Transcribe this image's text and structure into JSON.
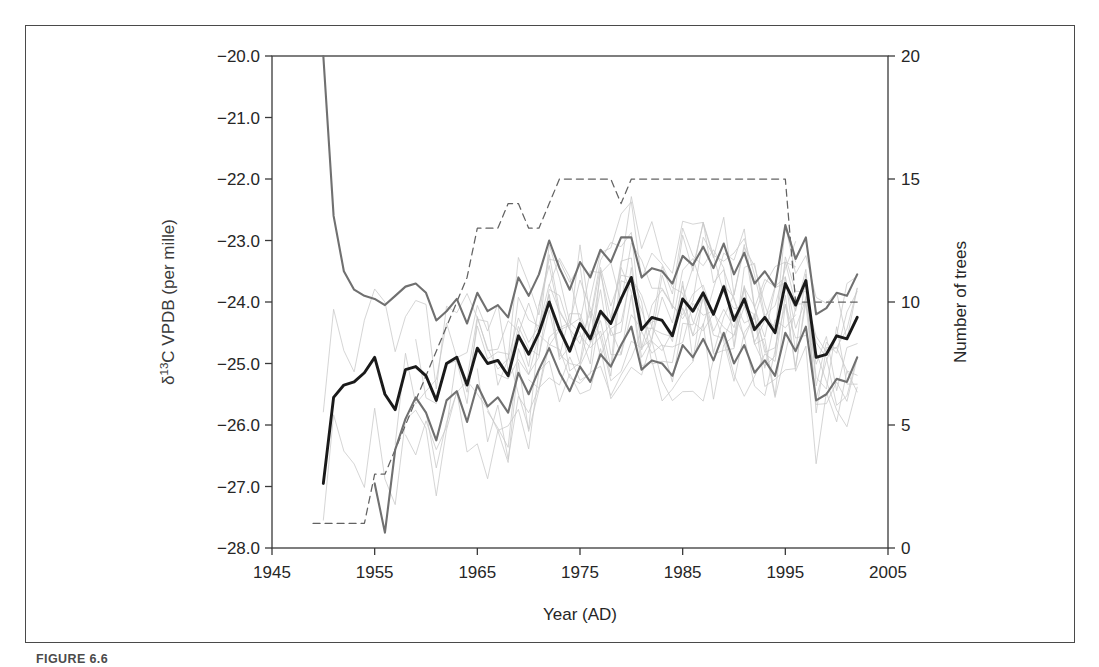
{
  "figure": {
    "caption_label": "FIGURE 6.6",
    "caption_rest": ""
  },
  "chart_data": {
    "type": "line",
    "title": "",
    "xlabel": "Year (AD)",
    "ylabel": "δ¹³C VPDB (per mille)",
    "ylabel_parts": {
      "delta": "δ",
      "sup": "13",
      "rest": "C VPDB (per mille)"
    },
    "y2label": "Number of trees",
    "xlim": [
      1945,
      2005
    ],
    "ylim": [
      -28.0,
      -20.0
    ],
    "y2lim": [
      0,
      20
    ],
    "grid": false,
    "legend": "none",
    "xticks": [
      1945,
      1955,
      1965,
      1975,
      1985,
      1995,
      2005
    ],
    "xticklabels": [
      "1945",
      "1955",
      "1965",
      "1975",
      "1985",
      "1995",
      "2005"
    ],
    "yticks": [
      -28.0,
      -27.0,
      -26.0,
      -25.0,
      -24.0,
      -23.0,
      -22.0,
      -21.0,
      -20.0
    ],
    "yticklabels": [
      "-28.0",
      "-27.0",
      "-26.0",
      "-25.0",
      "-24.0",
      "-23.0",
      "-22.0",
      "-21.0",
      "-20.0"
    ],
    "y2ticks": [
      0,
      5,
      10,
      15,
      20
    ],
    "y2ticklabels": [
      "0",
      "5",
      "10",
      "15",
      "20"
    ],
    "colors": {
      "mean": "#1a1a1a",
      "envelope": "#707070",
      "individual": "#c8c8c8",
      "treecount": "#5a5a5a",
      "axis": "#3a3a3a",
      "frame": "#4a4a4a"
    },
    "series": [
      {
        "name": "Mean δ13C",
        "role": "mean",
        "axis": "left",
        "style": "solid-thick",
        "x": [
          1950,
          1951,
          1952,
          1953,
          1954,
          1955,
          1956,
          1957,
          1958,
          1959,
          1960,
          1961,
          1962,
          1963,
          1964,
          1965,
          1966,
          1967,
          1968,
          1969,
          1970,
          1971,
          1972,
          1973,
          1974,
          1975,
          1976,
          1977,
          1978,
          1979,
          1980,
          1981,
          1982,
          1983,
          1984,
          1985,
          1986,
          1987,
          1988,
          1989,
          1990,
          1991,
          1992,
          1993,
          1994,
          1995,
          1996,
          1997,
          1998,
          1999,
          2000,
          2001,
          2002
        ],
        "values": [
          -26.95,
          -25.55,
          -25.35,
          -25.3,
          -25.15,
          -24.9,
          -25.5,
          -25.75,
          -25.1,
          -25.05,
          -25.2,
          -25.6,
          -25.0,
          -24.9,
          -25.35,
          -24.75,
          -25.0,
          -24.95,
          -25.2,
          -24.55,
          -24.85,
          -24.5,
          -24.0,
          -24.45,
          -24.8,
          -24.35,
          -24.6,
          -24.15,
          -24.35,
          -23.95,
          -23.6,
          -24.45,
          -24.25,
          -24.3,
          -24.55,
          -23.95,
          -24.15,
          -23.85,
          -24.2,
          -23.75,
          -24.3,
          -23.95,
          -24.45,
          -24.25,
          -24.5,
          -23.7,
          -24.05,
          -23.65,
          -24.9,
          -24.85,
          -24.55,
          -24.6,
          -24.25
        ]
      },
      {
        "name": "Upper envelope",
        "role": "upper",
        "axis": "left",
        "style": "solid-medium",
        "x": [
          1950,
          1951,
          1952,
          1953,
          1954,
          1955,
          1956,
          1957,
          1958,
          1959,
          1960,
          1961,
          1962,
          1963,
          1964,
          1965,
          1966,
          1967,
          1968,
          1969,
          1970,
          1971,
          1972,
          1973,
          1974,
          1975,
          1976,
          1977,
          1978,
          1979,
          1980,
          1981,
          1982,
          1983,
          1984,
          1985,
          1986,
          1987,
          1988,
          1989,
          1990,
          1991,
          1992,
          1993,
          1994,
          1995,
          1996,
          1997,
          1998,
          1999,
          2000,
          2001,
          2002
        ],
        "values": [
          -20.0,
          -22.6,
          -23.5,
          -23.8,
          -23.9,
          -23.95,
          -24.05,
          -23.9,
          -23.75,
          -23.7,
          -23.85,
          -24.3,
          -24.15,
          -23.95,
          -24.35,
          -23.85,
          -24.15,
          -24.05,
          -24.25,
          -23.6,
          -23.9,
          -23.55,
          -23.0,
          -23.45,
          -23.8,
          -23.35,
          -23.6,
          -23.15,
          -23.35,
          -22.95,
          -22.95,
          -23.6,
          -23.45,
          -23.5,
          -23.7,
          -23.25,
          -23.4,
          -23.1,
          -23.45,
          -23.05,
          -23.55,
          -23.2,
          -23.7,
          -23.5,
          -23.75,
          -22.75,
          -23.3,
          -22.95,
          -24.2,
          -24.1,
          -23.85,
          -23.9,
          -23.55
        ]
      },
      {
        "name": "Lower envelope",
        "role": "lower",
        "axis": "left",
        "style": "solid-medium",
        "x": [
          1955,
          1956,
          1957,
          1958,
          1959,
          1960,
          1961,
          1962,
          1963,
          1964,
          1965,
          1966,
          1967,
          1968,
          1969,
          1970,
          1971,
          1972,
          1973,
          1974,
          1975,
          1976,
          1977,
          1978,
          1979,
          1980,
          1981,
          1982,
          1983,
          1984,
          1985,
          1986,
          1987,
          1988,
          1989,
          1990,
          1991,
          1992,
          1993,
          1994,
          1995,
          1996,
          1997,
          1998,
          1999,
          2000,
          2001,
          2002
        ],
        "values": [
          -26.95,
          -27.75,
          -26.4,
          -25.9,
          -25.55,
          -25.8,
          -26.25,
          -25.6,
          -25.45,
          -25.95,
          -25.35,
          -25.7,
          -25.55,
          -25.8,
          -25.15,
          -25.5,
          -25.1,
          -24.75,
          -25.15,
          -25.45,
          -25.05,
          -25.3,
          -24.85,
          -25.05,
          -24.7,
          -24.4,
          -25.1,
          -24.95,
          -25.0,
          -25.2,
          -24.7,
          -24.9,
          -24.6,
          -24.95,
          -24.5,
          -25.0,
          -24.7,
          -25.15,
          -24.95,
          -25.2,
          -24.5,
          -24.8,
          -24.4,
          -25.6,
          -25.5,
          -25.25,
          -25.3,
          -24.9
        ]
      },
      {
        "name": "Individual trees (faint)",
        "role": "individual",
        "axis": "left",
        "style": "thin-faint",
        "count": 15,
        "note": "Individual tree ring series scattered between roughly -27.0 and -22.5 per mille"
      },
      {
        "name": "Number of trees",
        "role": "treecount",
        "axis": "right",
        "style": "dashed",
        "x": [
          1949,
          1950,
          1951,
          1952,
          1953,
          1954,
          1955,
          1956,
          1957,
          1958,
          1959,
          1960,
          1961,
          1962,
          1963,
          1964,
          1965,
          1966,
          1967,
          1968,
          1969,
          1970,
          1971,
          1972,
          1973,
          1974,
          1975,
          1976,
          1977,
          1978,
          1979,
          1980,
          1981,
          1982,
          1983,
          1984,
          1985,
          1986,
          1987,
          1988,
          1989,
          1990,
          1991,
          1992,
          1993,
          1994,
          1995,
          1996,
          1997,
          1998,
          1999,
          2000,
          2001,
          2002
        ],
        "values": [
          1,
          1,
          1,
          1,
          1,
          1,
          3,
          3,
          4,
          5,
          6,
          7,
          8,
          9,
          10,
          11,
          13,
          13,
          13,
          14,
          14,
          13,
          13,
          14,
          15,
          15,
          15,
          15,
          15,
          15,
          14,
          15,
          15,
          15,
          15,
          15,
          15,
          15,
          15,
          15,
          15,
          15,
          15,
          15,
          15,
          15,
          15,
          10,
          10,
          10,
          10,
          10,
          10,
          10
        ]
      }
    ]
  }
}
